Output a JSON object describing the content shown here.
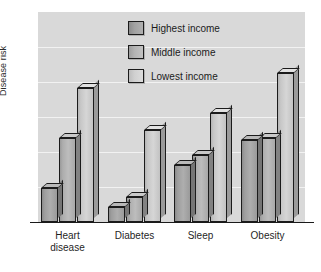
{
  "chart_data": {
    "type": "bar",
    "title": "",
    "subtitle": "",
    "xlabel": "",
    "ylabel": "Disease risk",
    "ylim": [
      0,
      100
    ],
    "grid": true,
    "grid_axis": "y",
    "legend_position": "top-center-inside",
    "categories": [
      "Heart disease",
      "Diabetes",
      "Sleep",
      "Obesity"
    ],
    "category_lines": [
      [
        "Heart",
        "disease"
      ],
      [
        "Diabetes"
      ],
      [
        "Sleep"
      ],
      [
        "Obesity"
      ]
    ],
    "series": [
      {
        "name": "Highest income",
        "color": "#a2a2a2",
        "values": [
          16,
          7,
          27,
          39
        ]
      },
      {
        "name": "Middle income",
        "color": "#b4b4b4",
        "values": [
          40,
          12,
          32,
          40
        ]
      },
      {
        "name": "Lowest income",
        "color": "#d0d0d0",
        "values": [
          64,
          44,
          52,
          71
        ]
      }
    ],
    "tick_labels_y": [],
    "gridline_count": 6,
    "axis_color": "#1a1a1a",
    "plot_background": "#d9d9d9",
    "gridline_color": "#f2f2f2",
    "page_background": "#ffffff"
  },
  "legend": {
    "items": [
      {
        "label": "Highest income"
      },
      {
        "label": "Middle income"
      },
      {
        "label": "Lowest income"
      }
    ]
  },
  "axes": {
    "y_title": "Disease risk"
  }
}
